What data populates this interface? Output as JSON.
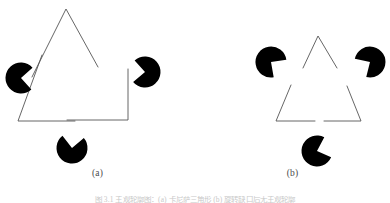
{
  "figure": {
    "kind": "kanizsa-triangle-illusion",
    "background_color": "#ffffff",
    "line_color": "#555555",
    "disc_color": "#000000",
    "caption_text": "图 3.1 主观轮廓图：(a) 卡尼萨三角形  (b) 旋转缺口后无主观轮廓"
  },
  "panels": [
    {
      "id": "a",
      "label": "(a)",
      "triangle": {
        "stroke": "#555555",
        "stroke_width": 0.9,
        "corners": [
          {
            "name": "apex",
            "points": "32,77 66,9 98,67"
          },
          {
            "name": "bottom-left",
            "points": "42,55 18,121 75,121"
          },
          {
            "name": "bottom-right",
            "points": "128,69 128,120 67,120"
          }
        ]
      },
      "discs": [
        {
          "name": "disc-left",
          "cx": 21,
          "cy": 78,
          "r": 15.5,
          "wedge_start_deg": -42,
          "wedge_end_deg": 48
        },
        {
          "name": "disc-right",
          "cx": 145,
          "cy": 72,
          "r": 15.5,
          "wedge_start_deg": 140,
          "wedge_end_deg": 228
        },
        {
          "name": "disc-bottom",
          "cx": 72,
          "cy": 148,
          "r": 15.5,
          "wedge_start_deg": 232,
          "wedge_end_deg": 320
        }
      ]
    },
    {
      "id": "b",
      "label": "(b)",
      "triangle": {
        "stroke": "#555555",
        "stroke_width": 0.9,
        "corners": [
          {
            "name": "apex",
            "points": "108,68 123,36 142,68"
          },
          {
            "name": "bottom-left",
            "points": "96,85 81,121 120,121"
          },
          {
            "name": "bottom-right",
            "points": "152,86 166,121 129,121"
          }
        ]
      },
      "discs": [
        {
          "name": "disc-left",
          "cx": 76,
          "cy": 62,
          "r": 15.5,
          "wedge_start_deg": -8,
          "wedge_end_deg": 80
        },
        {
          "name": "disc-right",
          "cx": 175,
          "cy": 62,
          "r": 15.5,
          "wedge_start_deg": 104,
          "wedge_end_deg": 192
        },
        {
          "name": "disc-bottom",
          "cx": 122,
          "cy": 151,
          "r": 15.5,
          "wedge_start_deg": -62,
          "wedge_end_deg": 24
        }
      ]
    }
  ]
}
